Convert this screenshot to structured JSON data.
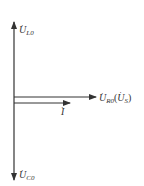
{
  "diagram": {
    "type": "phasor-diagram",
    "colors": {
      "line": "#333333",
      "text": "#333333",
      "background": "#ffffff"
    },
    "phasors": [
      {
        "id": "UL0",
        "symbol": "U",
        "subscript": "L0",
        "suffix": "",
        "direction": "up"
      },
      {
        "id": "UC0",
        "symbol": "U",
        "subscript": "C0",
        "suffix": "",
        "direction": "down"
      },
      {
        "id": "UR0",
        "symbol": "U",
        "subscript": "R0",
        "suffix_open": "(",
        "suffix_symbol": "U",
        "suffix_subscript": "S",
        "suffix_close": ")",
        "direction": "right"
      },
      {
        "id": "I",
        "symbol": "I",
        "subscript": "",
        "direction": "right"
      }
    ]
  }
}
